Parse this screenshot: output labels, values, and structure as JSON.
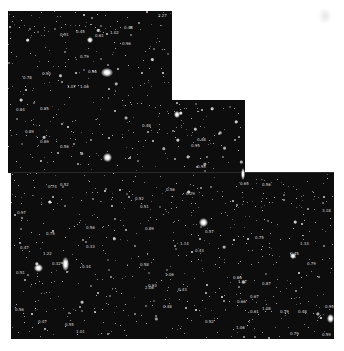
{
  "image": {
    "description": "Deep field astronomical mosaic of faint galaxies with redshift annotations",
    "background": "#ffffff",
    "sky_color": "#0b0b0b"
  },
  "panels": [
    {
      "id": "top-left-chip",
      "x": 8,
      "y": 11,
      "w": 164,
      "h": 162
    },
    {
      "id": "middle-chip",
      "x": 172,
      "y": 100,
      "w": 73,
      "h": 73
    },
    {
      "id": "bottom-chip",
      "x": 11,
      "y": 172,
      "w": 323,
      "h": 167
    }
  ],
  "bright_galaxies": [
    {
      "x": 107,
      "y": 72,
      "w": 12,
      "h": 9
    },
    {
      "x": 107,
      "y": 157,
      "w": 9,
      "h": 9
    },
    {
      "x": 177,
      "y": 114,
      "w": 6,
      "h": 7
    },
    {
      "x": 65,
      "y": 264,
      "w": 7,
      "h": 14
    },
    {
      "x": 203,
      "y": 222,
      "w": 9,
      "h": 9
    },
    {
      "x": 38,
      "y": 268,
      "w": 9,
      "h": 8
    },
    {
      "x": 330,
      "y": 318,
      "w": 7,
      "h": 9
    },
    {
      "x": 243,
      "y": 174,
      "w": 4,
      "h": 12
    },
    {
      "x": 90,
      "y": 40,
      "w": 6,
      "h": 6
    },
    {
      "x": 293,
      "y": 256,
      "w": 6,
      "h": 6
    }
  ],
  "redshift_labels": [
    {
      "x": 158,
      "y": 14,
      "text": "2.27"
    },
    {
      "x": 60,
      "y": 33,
      "text": "0.51"
    },
    {
      "x": 76,
      "y": 30,
      "text": "0.45"
    },
    {
      "x": 95,
      "y": 34,
      "text": "0.61"
    },
    {
      "x": 110,
      "y": 31,
      "text": "1.02"
    },
    {
      "x": 124,
      "y": 26,
      "text": "0.48"
    },
    {
      "x": 122,
      "y": 42,
      "text": "0.96"
    },
    {
      "x": 80,
      "y": 55,
      "text": "0.79"
    },
    {
      "x": 88,
      "y": 70,
      "text": "0.56"
    },
    {
      "x": 23,
      "y": 76,
      "text": "0.78"
    },
    {
      "x": 42,
      "y": 72,
      "text": "0.90"
    },
    {
      "x": 67,
      "y": 85,
      "text": "1.07"
    },
    {
      "x": 80,
      "y": 85,
      "text": "1.06"
    },
    {
      "x": 16,
      "y": 108,
      "text": "0.84"
    },
    {
      "x": 40,
      "y": 107,
      "text": "0.85"
    },
    {
      "x": 25,
      "y": 130,
      "text": "0.89"
    },
    {
      "x": 40,
      "y": 140,
      "text": "0.89"
    },
    {
      "x": 60,
      "y": 145,
      "text": "0.56"
    },
    {
      "x": 142,
      "y": 124,
      "text": "0.48"
    },
    {
      "x": 197,
      "y": 138,
      "text": "0.48"
    },
    {
      "x": 191,
      "y": 144,
      "text": "0.95"
    },
    {
      "x": 197,
      "y": 165,
      "text": "0.95"
    },
    {
      "x": 17,
      "y": 211,
      "text": "0.97"
    },
    {
      "x": 48,
      "y": 185,
      "text": "0.74"
    },
    {
      "x": 60,
      "y": 183,
      "text": "0.52"
    },
    {
      "x": 46,
      "y": 232,
      "text": "0.75"
    },
    {
      "x": 20,
      "y": 246,
      "text": "0.47"
    },
    {
      "x": 43,
      "y": 252,
      "text": "1.22"
    },
    {
      "x": 86,
      "y": 226,
      "text": "0.56"
    },
    {
      "x": 86,
      "y": 245,
      "text": "0.33"
    },
    {
      "x": 52,
      "y": 262,
      "text": "0.32"
    },
    {
      "x": 16,
      "y": 271,
      "text": "0.51"
    },
    {
      "x": 82,
      "y": 265,
      "text": "0.34"
    },
    {
      "x": 135,
      "y": 197,
      "text": "0.52"
    },
    {
      "x": 140,
      "y": 205,
      "text": "0.51"
    },
    {
      "x": 166,
      "y": 188,
      "text": "0.56"
    },
    {
      "x": 186,
      "y": 192,
      "text": "0.29"
    },
    {
      "x": 145,
      "y": 227,
      "text": "0.89"
    },
    {
      "x": 180,
      "y": 242,
      "text": "1.14"
    },
    {
      "x": 195,
      "y": 249,
      "text": "0.43"
    },
    {
      "x": 205,
      "y": 230,
      "text": "0.57"
    },
    {
      "x": 240,
      "y": 182,
      "text": "0.65"
    },
    {
      "x": 262,
      "y": 183,
      "text": "0.56"
    },
    {
      "x": 322,
      "y": 209,
      "text": "3.18"
    },
    {
      "x": 140,
      "y": 263,
      "text": "0.58"
    },
    {
      "x": 165,
      "y": 273,
      "text": "1.06"
    },
    {
      "x": 178,
      "y": 288,
      "text": "0.43"
    },
    {
      "x": 145,
      "y": 286,
      "text": "2.06"
    },
    {
      "x": 255,
      "y": 236,
      "text": "0.75"
    },
    {
      "x": 300,
      "y": 242,
      "text": "1.33"
    },
    {
      "x": 290,
      "y": 252,
      "text": "0.45"
    },
    {
      "x": 307,
      "y": 262,
      "text": "0.79"
    },
    {
      "x": 233,
      "y": 276,
      "text": "0.86"
    },
    {
      "x": 238,
      "y": 280,
      "text": "1.07"
    },
    {
      "x": 262,
      "y": 282,
      "text": "0.87"
    },
    {
      "x": 250,
      "y": 295,
      "text": "0.67"
    },
    {
      "x": 237,
      "y": 300,
      "text": "0.66"
    },
    {
      "x": 262,
      "y": 307,
      "text": "1.08"
    },
    {
      "x": 250,
      "y": 310,
      "text": "0.61"
    },
    {
      "x": 280,
      "y": 310,
      "text": "0.79"
    },
    {
      "x": 298,
      "y": 310,
      "text": "0.48"
    },
    {
      "x": 325,
      "y": 305,
      "text": "0.95"
    },
    {
      "x": 322,
      "y": 333,
      "text": "0.59"
    },
    {
      "x": 236,
      "y": 326,
      "text": "1.06"
    },
    {
      "x": 15,
      "y": 308,
      "text": "0.56"
    },
    {
      "x": 38,
      "y": 320,
      "text": "0.47"
    },
    {
      "x": 65,
      "y": 323,
      "text": "0.55"
    },
    {
      "x": 76,
      "y": 330,
      "text": "1.01"
    },
    {
      "x": 163,
      "y": 305,
      "text": "0.48"
    },
    {
      "x": 148,
      "y": 284,
      "text": "0.93"
    },
    {
      "x": 205,
      "y": 320,
      "text": "0.52"
    },
    {
      "x": 290,
      "y": 332,
      "text": "0.79"
    }
  ]
}
